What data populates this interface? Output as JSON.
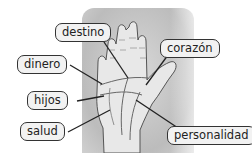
{
  "diagram": {
    "labels": [
      {
        "id": "destino",
        "text": "destino"
      },
      {
        "id": "corazon",
        "text": "corazón"
      },
      {
        "id": "dinero",
        "text": "dinero"
      },
      {
        "id": "hijos",
        "text": "hijos"
      },
      {
        "id": "salud",
        "text": "salud"
      },
      {
        "id": "personalidad",
        "text": "personalidad"
      }
    ],
    "colors": {
      "panel": "#c4c4c4",
      "hand": "#e6e6e6",
      "outline": "#333333",
      "label_bg": "#f2f2f2"
    }
  }
}
